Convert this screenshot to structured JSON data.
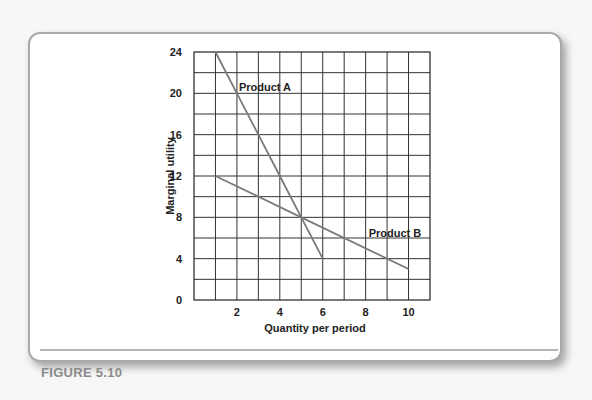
{
  "figure": {
    "caption": "FIGURE 5.10"
  },
  "chart_data": {
    "type": "line",
    "title": "",
    "xlabel": "Quantity per period",
    "ylabel": "Marginal utility",
    "xlim": [
      0,
      11
    ],
    "ylim": [
      0,
      24
    ],
    "x_ticks": [
      "2",
      "4",
      "6",
      "8",
      "10"
    ],
    "y_ticks": [
      "0",
      "4",
      "8",
      "12",
      "16",
      "20",
      "24"
    ],
    "grid": true,
    "series": [
      {
        "name": "Product A",
        "x": [
          1,
          2,
          3,
          4,
          5,
          6
        ],
        "values": [
          24,
          20,
          16,
          12,
          8,
          4
        ]
      },
      {
        "name": "Product B",
        "x": [
          1,
          5,
          10
        ],
        "values": [
          12,
          8,
          3
        ]
      }
    ],
    "annotations": [
      {
        "text": "Product A",
        "x": 2,
        "y": 20
      },
      {
        "text": "Product B",
        "x": 8,
        "y": 6.5
      }
    ]
  }
}
